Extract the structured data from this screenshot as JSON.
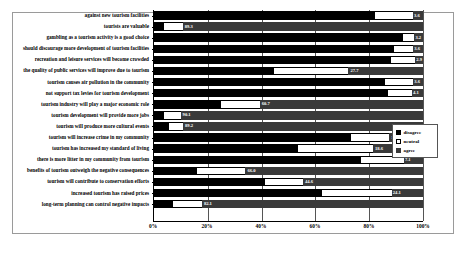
{
  "chart_data": {
    "type": "bar",
    "subtype": "stacked-horizontal-100pct",
    "title": "",
    "xlabel": "",
    "ylabel": "",
    "xlim": [
      0,
      100
    ],
    "xticks": [
      "0%",
      "20%",
      "40%",
      "60%",
      "80%",
      "100%"
    ],
    "xtick_values": [
      0,
      20,
      40,
      60,
      80,
      100
    ],
    "grid": true,
    "legend_position": "right",
    "legend": [
      "disagree",
      "neutral",
      "agree"
    ],
    "colors": {
      "disagree": "#000000",
      "neutral": "#ffffff",
      "agree": "#3a3a3a"
    },
    "categories": [
      "against new tourism facilities",
      "tourists are valuable",
      "gambling as a tourism activity is a good choice",
      "should discourage more development of tourism facilities",
      "recreation and leisure services will become crowded",
      "the quality of public services will improve due to tourism",
      "tourism causes air pollution in the community",
      "not support tax levies for tourism development",
      "tourism industry will play a major economic role",
      "tourism development will provide more jobs",
      "tourism will produce more cultural events",
      "tourism will increase crime in my community",
      "tourism has increased my standard of living",
      "there is more litter in my community from tourism",
      "benefits of tourism outweigh the negative consequences",
      "tourism will contribute to conservation efforts",
      "increased tourism has raised prices",
      "long-term planning can control negative impacts"
    ],
    "series": [
      {
        "name": "disagree",
        "values": [
          82.0,
          3.6,
          92.5,
          89.3,
          88.2,
          44.6,
          85.7,
          87.0,
          25.0,
          3.6,
          5.4,
          73.2,
          53.6,
          76.8,
          16.1,
          41.1,
          62.5,
          7.1
        ]
      },
      {
        "name": "neutral",
        "values": [
          14.3,
          7.1,
          4.3,
          7.1,
          8.9,
          27.7,
          10.7,
          8.9,
          14.3,
          6.3,
          5.4,
          14.3,
          27.8,
          16.1,
          17.9,
          14.3,
          25.9,
          10.7
        ]
      },
      {
        "name": "agree",
        "values": [
          3.7,
          89.3,
          3.2,
          3.6,
          2.9,
          27.7,
          3.6,
          4.1,
          60.7,
          90.1,
          89.2,
          12.5,
          18.6,
          7.1,
          66.0,
          44.6,
          11.6,
          82.1
        ]
      }
    ],
    "data_labels": [
      {
        "row": 0,
        "series": "agree",
        "text": "3.6"
      },
      {
        "row": 1,
        "series": "agree",
        "text": "89.3"
      },
      {
        "row": 2,
        "series": "agree",
        "text": "3.2"
      },
      {
        "row": 3,
        "series": "agree",
        "text": "3.6"
      },
      {
        "row": 4,
        "series": "agree",
        "text": "2.9"
      },
      {
        "row": 5,
        "series": "agree",
        "text": "27.7"
      },
      {
        "row": 6,
        "series": "agree",
        "text": "3.6"
      },
      {
        "row": 7,
        "series": "agree",
        "text": "4.1"
      },
      {
        "row": 8,
        "series": "agree",
        "text": "60.7"
      },
      {
        "row": 9,
        "series": "agree",
        "text": "90.1"
      },
      {
        "row": 10,
        "series": "agree",
        "text": "89.2"
      },
      {
        "row": 11,
        "series": "agree",
        "text": "12.5"
      },
      {
        "row": 12,
        "series": "agree",
        "text": "18.6"
      },
      {
        "row": 13,
        "series": "agree",
        "text": "7.1"
      },
      {
        "row": 14,
        "series": "agree",
        "text": "66.0"
      },
      {
        "row": 15,
        "series": "agree",
        "text": "44.6"
      },
      {
        "row": 16,
        "series": "agree",
        "text": "24.1"
      },
      {
        "row": 17,
        "series": "agree",
        "text": "82.1"
      }
    ]
  }
}
